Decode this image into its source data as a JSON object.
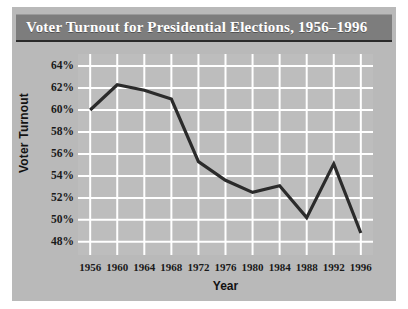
{
  "figure": {
    "title": "Voter Turnout for Presidential Elections, 1956–1996",
    "panel_color": "#b9b9b9",
    "banner_color": "#7d7d7d",
    "plot_bg_color": "#bdbdbd",
    "grid_color": "#ffffff",
    "line_color": "#2b2b2b"
  },
  "chart_data": {
    "type": "line",
    "title": "Voter Turnout for Presidential Elections, 1956–1996",
    "xlabel": "Year",
    "ylabel": "Voter Turnout",
    "categories": [
      1956,
      1960,
      1964,
      1968,
      1972,
      1976,
      1980,
      1984,
      1988,
      1992,
      1996
    ],
    "x_tick_labels": [
      "1956",
      "1960",
      "1964",
      "1968",
      "1972",
      "1976",
      "1980",
      "1984",
      "1988",
      "1992",
      "1996"
    ],
    "values": [
      60.0,
      62.3,
      61.8,
      61.0,
      55.3,
      53.6,
      52.5,
      53.1,
      50.2,
      55.1,
      48.8
    ],
    "y_tick_labels": [
      "64%",
      "62%",
      "60%",
      "58%",
      "56%",
      "54%",
      "52%",
      "50%",
      "48%"
    ],
    "y_tick_values": [
      64,
      62,
      60,
      58,
      56,
      54,
      52,
      50,
      48
    ],
    "ylim": [
      46.8,
      65.1
    ],
    "xlim": [
      1954.2,
      1997.8
    ],
    "grid": true,
    "legend": false,
    "series": [
      {
        "name": "Voter Turnout",
        "values": [
          60.0,
          62.3,
          61.8,
          61.0,
          55.3,
          53.6,
          52.5,
          53.1,
          50.2,
          55.1,
          48.8
        ]
      }
    ]
  }
}
